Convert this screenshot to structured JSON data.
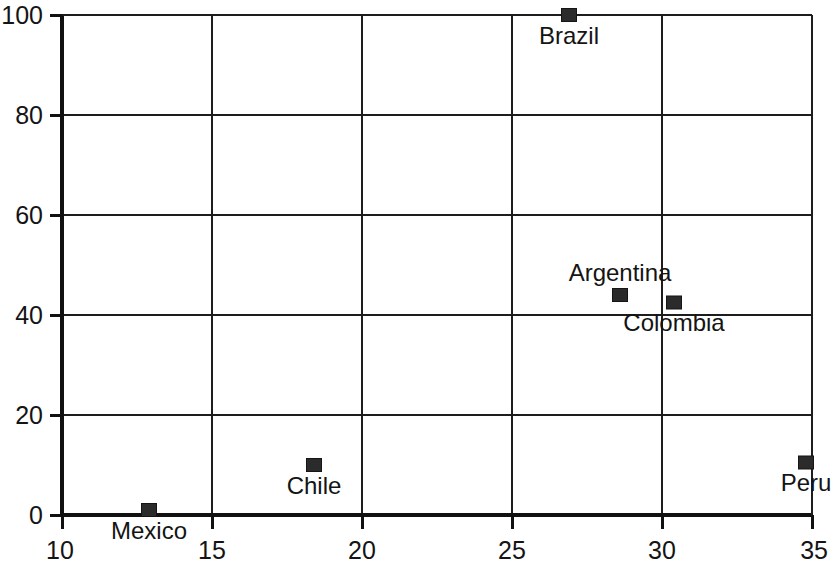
{
  "chart_data": {
    "type": "scatter",
    "title": "",
    "xlabel": "",
    "ylabel": "",
    "xlim": [
      10,
      35
    ],
    "ylim": [
      0,
      100
    ],
    "grid": true,
    "legend": "none",
    "x_ticks": [
      10,
      15,
      20,
      25,
      30,
      35
    ],
    "y_ticks": [
      0,
      20,
      40,
      60,
      80,
      100
    ],
    "x_tick_labels": [
      "10",
      "15",
      "20",
      "25",
      "30",
      "35"
    ],
    "y_tick_labels": [
      "0",
      "20",
      "40",
      "60",
      "80",
      "100"
    ],
    "marker_style": "filled-square",
    "points": [
      {
        "label": "Brazil",
        "x": 26.9,
        "y": 100.0,
        "label_pos": "below"
      },
      {
        "label": "Argentina",
        "x": 28.6,
        "y": 44.0,
        "label_pos": "above"
      },
      {
        "label": "Colombia",
        "x": 30.4,
        "y": 42.5,
        "label_pos": "below"
      },
      {
        "label": "Peru",
        "x": 34.8,
        "y": 10.5,
        "label_pos": "below"
      },
      {
        "label": "Chile",
        "x": 18.4,
        "y": 10.0,
        "label_pos": "below"
      },
      {
        "label": "Mexico",
        "x": 12.9,
        "y": 1.0,
        "label_pos": "below"
      }
    ]
  },
  "colors": {
    "marker": "#2b2b2b",
    "grid": "#1d1d1d",
    "axis": "#111111",
    "text": "#141414",
    "background": "#ffffff"
  }
}
